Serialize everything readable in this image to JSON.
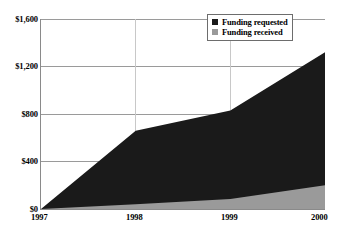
{
  "chart_data": {
    "type": "area",
    "title": "",
    "subtitle": "",
    "xlabel": "",
    "ylabel": "",
    "x": [
      "1997",
      "1998",
      "1999",
      "2000"
    ],
    "categories": [
      "1997",
      "1998",
      "1999",
      "2000"
    ],
    "series": [
      {
        "name": "Funding requested",
        "color": "#1a1a1a",
        "values": [
          0,
          660,
          830,
          1320
        ]
      },
      {
        "name": "Funding received",
        "color": "#9a9a9a",
        "values": [
          0,
          40,
          85,
          200
        ]
      }
    ],
    "ylim": [
      0,
      1600
    ],
    "yticks": [
      0,
      400,
      800,
      1200,
      1600
    ],
    "ytick_labels": [
      "$0",
      "$400",
      "$800",
      "$1,200",
      "$1,600"
    ],
    "xticks": [
      "1997",
      "1998",
      "1999",
      "2000"
    ],
    "grid": "horizontal-major",
    "legend_position": "top-right",
    "stacked": false,
    "annotations": []
  },
  "legend": {
    "items": [
      {
        "label": "Funding requested",
        "color": "#1a1a1a",
        "swatch": "square-black-icon"
      },
      {
        "label": "Funding received",
        "color": "#9a9a9a",
        "swatch": "square-gray-icon"
      }
    ]
  },
  "axes": {
    "y": {
      "labels": [
        "$1,600",
        "$1,200",
        "$800",
        "$400",
        "$0"
      ]
    },
    "x": {
      "labels": [
        "1997",
        "1998",
        "1999",
        "2000"
      ]
    }
  },
  "colors": {
    "requested": "#1a1a1a",
    "received": "#9a9a9a",
    "gridline": "#9a9a9a",
    "axis": "#8a8a8a",
    "background": "#ffffff",
    "text": "#000000"
  }
}
